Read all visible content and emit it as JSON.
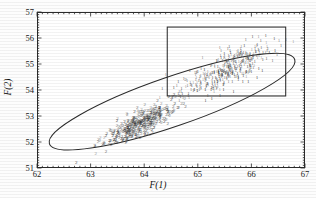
{
  "chart_data": {
    "type": "scatter",
    "title": "",
    "xlabel": "F(1)",
    "ylabel": "F(2)",
    "xlim": [
      62,
      67
    ],
    "ylim": [
      51,
      57
    ],
    "xticks": [
      "62",
      "63",
      "64",
      "65",
      "66",
      "67"
    ],
    "yticks": [
      "51",
      "52",
      "53",
      "54",
      "55",
      "56",
      "57"
    ],
    "xtick_values": [
      62,
      63,
      64,
      65,
      66,
      67
    ],
    "ytick_values": [
      51,
      52,
      53,
      54,
      55,
      56,
      57
    ],
    "minor_ticks_per_interval": 10,
    "grid": false,
    "legend": null,
    "point_marker": "digit-glyph",
    "annotations": [
      {
        "name": "confidence-ellipse",
        "shape": "ellipse",
        "center_x": 64.52,
        "center_y": 53.55,
        "semi_major": 2.42,
        "semi_minor": 0.95,
        "rotation_deg": -19.0,
        "color": "#2b2b2b"
      },
      {
        "name": "selection-rectangle",
        "shape": "rectangle",
        "x_min": 64.43,
        "x_max": 66.64,
        "y_min": 53.77,
        "y_max": 56.42,
        "color": "#2b2b2b"
      }
    ],
    "series": [
      {
        "name": "2",
        "label": "2",
        "marker_text": "2",
        "color": "#2e2e2e",
        "n_points": 430,
        "x_mean": 63.92,
        "y_mean": 52.72,
        "x_sd": 0.33,
        "y_sd": 0.42,
        "correlation": 0.83
      },
      {
        "name": "1",
        "label": "1",
        "marker_text": "1",
        "color": "#4a4a4a",
        "n_points": 400,
        "x_mean": 65.55,
        "y_mean": 54.82,
        "x_sd": 0.42,
        "y_sd": 0.52,
        "correlation": 0.78
      }
    ]
  },
  "figure": {
    "background": "#ffffff",
    "frame_color": "#2b2b2b",
    "text_color": "#1a1a1a"
  }
}
